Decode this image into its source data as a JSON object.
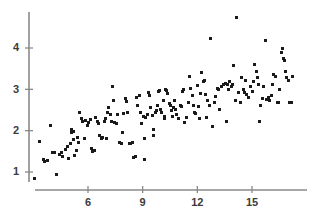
{
  "chart_data": {
    "type": "scatter",
    "title": "",
    "xlabel": "",
    "ylabel": "",
    "xlim": [
      2.6,
      18.2
    ],
    "ylim": [
      0.55,
      4.95
    ],
    "grid": false,
    "legend": null,
    "marker": {
      "shape": "square",
      "size_px": 3,
      "color": "#1a1a1a"
    },
    "axis_color": "#8a8a8a",
    "xticks": [
      6,
      9,
      12,
      15
    ],
    "xtick_labels": [
      "6",
      "9",
      "12",
      "15"
    ],
    "yticks": [
      1,
      2,
      3,
      4
    ],
    "ytick_labels": [
      "1",
      "2",
      "3",
      "4"
    ],
    "n_points": 186,
    "points": [
      [
        3.05,
        0.85
      ],
      [
        3.35,
        1.75
      ],
      [
        3.55,
        1.3
      ],
      [
        3.62,
        1.25
      ],
      [
        3.78,
        1.27
      ],
      [
        3.95,
        2.13
      ],
      [
        4.05,
        1.46
      ],
      [
        4.18,
        1.47
      ],
      [
        4.25,
        0.95
      ],
      [
        4.42,
        1.42
      ],
      [
        4.55,
        1.48
      ],
      [
        4.62,
        1.37
      ],
      [
        4.78,
        1.55
      ],
      [
        4.85,
        1.62
      ],
      [
        4.92,
        1.33
      ],
      [
        5.02,
        1.7
      ],
      [
        5.08,
        1.95
      ],
      [
        5.12,
        2.02
      ],
      [
        5.18,
        1.78
      ],
      [
        5.22,
        1.97
      ],
      [
        5.28,
        1.4
      ],
      [
        5.35,
        1.52
      ],
      [
        5.42,
        1.84
      ],
      [
        5.48,
        1.72
      ],
      [
        5.55,
        2.43
      ],
      [
        5.62,
        2.3
      ],
      [
        5.72,
        2.22
      ],
      [
        5.82,
        1.8
      ],
      [
        5.88,
        2.25
      ],
      [
        5.95,
        2.12
      ],
      [
        6.05,
        2.2
      ],
      [
        6.12,
        2.28
      ],
      [
        6.18,
        1.57
      ],
      [
        6.25,
        1.49
      ],
      [
        6.35,
        1.53
      ],
      [
        6.42,
        2.33
      ],
      [
        6.52,
        2.22
      ],
      [
        6.58,
        2.18
      ],
      [
        6.65,
        1.88
      ],
      [
        6.72,
        1.8
      ],
      [
        6.82,
        1.84
      ],
      [
        6.88,
        2.21
      ],
      [
        6.95,
        2.3
      ],
      [
        7.02,
        1.82
      ],
      [
        7.08,
        2.45
      ],
      [
        7.15,
        2.55
      ],
      [
        7.22,
        2.38
      ],
      [
        7.28,
        2.22
      ],
      [
        7.35,
        3.08
      ],
      [
        7.42,
        2.72
      ],
      [
        7.48,
        2.2
      ],
      [
        7.55,
        2.18
      ],
      [
        7.62,
        2.4
      ],
      [
        7.72,
        1.72
      ],
      [
        7.82,
        1.7
      ],
      [
        7.88,
        1.95
      ],
      [
        7.95,
        2.42
      ],
      [
        8.05,
        2.78
      ],
      [
        8.12,
        2.7
      ],
      [
        8.18,
        2.45
      ],
      [
        8.25,
        1.7
      ],
      [
        8.35,
        1.68
      ],
      [
        8.42,
        1.72
      ],
      [
        8.52,
        1.36
      ],
      [
        8.58,
        1.38
      ],
      [
        8.65,
        2.8
      ],
      [
        8.72,
        2.62
      ],
      [
        8.82,
        2.85
      ],
      [
        8.88,
        2.43
      ],
      [
        8.95,
        2.18
      ],
      [
        9.02,
        2.35
      ],
      [
        9.08,
        1.82
      ],
      [
        9.12,
        1.3
      ],
      [
        9.18,
        2.33
      ],
      [
        9.25,
        2.4
      ],
      [
        9.32,
        2.92
      ],
      [
        9.38,
        2.86
      ],
      [
        9.45,
        2.55
      ],
      [
        9.52,
        2.36
      ],
      [
        9.58,
        2.04
      ],
      [
        9.62,
        1.88
      ],
      [
        9.68,
        2.45
      ],
      [
        9.75,
        2.5
      ],
      [
        9.82,
        2.62
      ],
      [
        9.88,
        2.95
      ],
      [
        9.95,
        2.98
      ],
      [
        10.0,
        2.52
      ],
      [
        10.05,
        2.43
      ],
      [
        10.12,
        2.72
      ],
      [
        10.18,
        2.3
      ],
      [
        10.22,
        2.35
      ],
      [
        10.28,
        3.0
      ],
      [
        10.32,
        2.98
      ],
      [
        10.38,
        2.9
      ],
      [
        10.45,
        2.66
      ],
      [
        10.52,
        2.6
      ],
      [
        10.58,
        2.48
      ],
      [
        10.62,
        2.35
      ],
      [
        10.68,
        2.55
      ],
      [
        10.75,
        2.72
      ],
      [
        10.82,
        2.52
      ],
      [
        10.88,
        2.4
      ],
      [
        10.95,
        2.3
      ],
      [
        11.05,
        2.6
      ],
      [
        11.12,
        2.58
      ],
      [
        11.18,
        2.95
      ],
      [
        11.25,
        3.0
      ],
      [
        11.32,
        2.2
      ],
      [
        11.42,
        2.32
      ],
      [
        11.52,
        2.68
      ],
      [
        11.58,
        3.3
      ],
      [
        11.65,
        3.02
      ],
      [
        11.72,
        2.85
      ],
      [
        11.78,
        2.62
      ],
      [
        11.85,
        2.45
      ],
      [
        11.92,
        2.42
      ],
      [
        12.0,
        3.1
      ],
      [
        12.05,
        2.58
      ],
      [
        12.12,
        2.3
      ],
      [
        12.18,
        2.9
      ],
      [
        12.25,
        3.4
      ],
      [
        12.32,
        3.18
      ],
      [
        12.38,
        3.22
      ],
      [
        12.45,
        2.88
      ],
      [
        12.52,
        2.32
      ],
      [
        12.58,
        2.72
      ],
      [
        12.65,
        2.6
      ],
      [
        12.72,
        4.22
      ],
      [
        12.82,
        2.1
      ],
      [
        12.92,
        2.68
      ],
      [
        13.0,
        2.82
      ],
      [
        13.08,
        3.02
      ],
      [
        13.15,
        3.0
      ],
      [
        13.22,
        2.52
      ],
      [
        13.32,
        3.08
      ],
      [
        13.42,
        3.12
      ],
      [
        13.52,
        3.14
      ],
      [
        13.58,
        2.22
      ],
      [
        13.65,
        3.12
      ],
      [
        13.72,
        3.0
      ],
      [
        13.78,
        3.18
      ],
      [
        13.85,
        3.08
      ],
      [
        13.92,
        3.12
      ],
      [
        14.0,
        3.58
      ],
      [
        14.08,
        2.72
      ],
      [
        14.15,
        4.75
      ],
      [
        14.25,
        2.92
      ],
      [
        14.35,
        2.68
      ],
      [
        14.45,
        3.28
      ],
      [
        14.52,
        3.0
      ],
      [
        14.58,
        2.92
      ],
      [
        14.65,
        3.22
      ],
      [
        14.72,
        2.88
      ],
      [
        14.82,
        2.8
      ],
      [
        14.92,
        3.08
      ],
      [
        15.0,
        2.95
      ],
      [
        15.08,
        3.18
      ],
      [
        15.15,
        3.6
      ],
      [
        15.22,
        3.42
      ],
      [
        15.28,
        3.28
      ],
      [
        15.35,
        3.12
      ],
      [
        15.42,
        2.22
      ],
      [
        15.48,
        2.62
      ],
      [
        15.55,
        2.78
      ],
      [
        15.62,
        3.08
      ],
      [
        15.72,
        4.18
      ],
      [
        15.82,
        2.75
      ],
      [
        15.88,
        2.8
      ],
      [
        15.95,
        2.72
      ],
      [
        16.05,
        2.85
      ],
      [
        16.12,
        3.12
      ],
      [
        16.18,
        3.35
      ],
      [
        16.28,
        3.3
      ],
      [
        16.38,
        2.68
      ],
      [
        16.45,
        2.68
      ],
      [
        16.52,
        3.0
      ],
      [
        16.62,
        3.88
      ],
      [
        16.68,
        3.98
      ],
      [
        16.72,
        3.74
      ],
      [
        16.78,
        3.7
      ],
      [
        16.85,
        3.42
      ],
      [
        16.92,
        3.28
      ],
      [
        17.0,
        3.22
      ],
      [
        17.08,
        2.68
      ],
      [
        17.15,
        2.68
      ],
      [
        17.22,
        3.3
      ]
    ]
  },
  "axes": {
    "y_axis_name": "y-axis",
    "x_axis_name": "x-axis"
  }
}
